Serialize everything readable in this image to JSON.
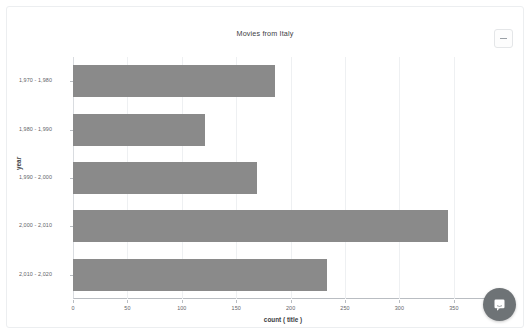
{
  "card": {
    "title": "Movies from Italy",
    "menu_button_icon": "minimize-icon"
  },
  "chat": {
    "icon": "chat-bubble-icon",
    "color": "#6e7376"
  },
  "chart_data": {
    "type": "bar",
    "orientation": "horizontal",
    "title": "Movies from Italy",
    "xlabel": "count ( title )",
    "ylabel": "year",
    "categories": [
      "1,970 - 1,980",
      "1,980 - 1,990",
      "1,990 - 2,000",
      "2,000 - 2,010",
      "2,010 - 2,020"
    ],
    "values": [
      186,
      121,
      169,
      345,
      233
    ],
    "xlim": [
      0,
      386
    ],
    "xticks": [
      0,
      50,
      100,
      150,
      200,
      250,
      300,
      350
    ],
    "xticklabels": [
      "0",
      "50",
      "100",
      "150",
      "200",
      "250",
      "300",
      "350"
    ],
    "grid": true,
    "legend": false,
    "bar_color": "#8a8a8a"
  }
}
